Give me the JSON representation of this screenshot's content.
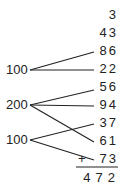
{
  "addends": [
    "3",
    "43",
    "86",
    "22",
    "56",
    "94",
    "37",
    "61",
    "73"
  ],
  "plus_sign": "+",
  "total": "472",
  "groups": [
    {
      "label": "100",
      "connects": [
        "86",
        "22"
      ]
    },
    {
      "label": "200",
      "connects": [
        "56",
        "94",
        "61"
      ]
    },
    {
      "label": "100",
      "connects": [
        "37",
        "73"
      ]
    }
  ]
}
